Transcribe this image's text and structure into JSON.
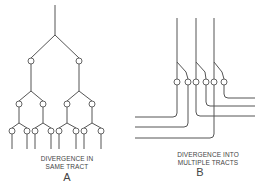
{
  "figure": {
    "panel_a": {
      "caption_line1": "DIVERGENCE IN",
      "caption_line2": "SAME TRACT",
      "letter": "A"
    },
    "panel_b": {
      "caption_line1": "DIVERGENCE INTO",
      "caption_line2": "MULTIPLE TRACTS",
      "letter": "B"
    },
    "colors": {
      "line": "#555555",
      "background": "#ffffff"
    }
  }
}
